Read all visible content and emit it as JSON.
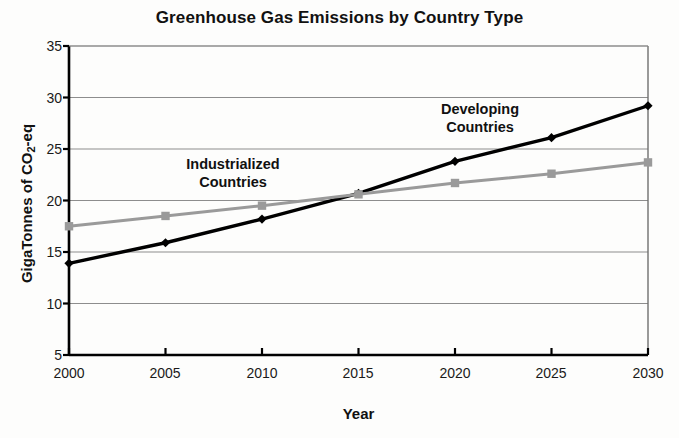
{
  "chart_data": {
    "type": "line",
    "title": "Greenhouse Gas Emissions by Country Type",
    "xlabel": "Year",
    "ylabel": "GigaTonnes of CO2-eq",
    "ylabel_main": "GigaTonnes of CO",
    "ylabel_sub": "2",
    "ylabel_tail": "-eq",
    "x": [
      2000,
      2005,
      2010,
      2015,
      2020,
      2025,
      2030
    ],
    "xlim": [
      2000,
      2030
    ],
    "ylim": [
      5,
      35
    ],
    "xticks": [
      "2000",
      "2005",
      "2010",
      "2015",
      "2020",
      "2025",
      "2030"
    ],
    "yticks": [
      "5",
      "10",
      "15",
      "20",
      "25",
      "30",
      "35"
    ],
    "grid": "horizontal",
    "legend": "inline-annotations",
    "series": [
      {
        "name": "Developing Countries",
        "color": "#000000",
        "marker": "diamond",
        "values": [
          13.9,
          15.9,
          18.2,
          20.7,
          23.8,
          26.1,
          29.2
        ]
      },
      {
        "name": "Industrialized Countries",
        "color": "#9a9a9a",
        "marker": "square",
        "values": [
          17.5,
          18.5,
          19.5,
          20.6,
          21.7,
          22.6,
          23.7
        ]
      }
    ],
    "annotations": [
      {
        "text_line1": "Industrialized",
        "text_line2": "Countries"
      },
      {
        "text_line1": "Developing",
        "text_line2": "Countries"
      }
    ]
  }
}
